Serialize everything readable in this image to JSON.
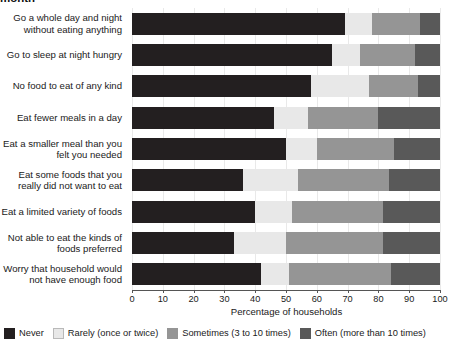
{
  "chart_data": {
    "type": "bar",
    "orientation": "horizontal",
    "stacked": true,
    "stacked_percent": true,
    "title": "month",
    "xlabel": "Percentage of households",
    "ylabel": "",
    "xlim": [
      0,
      100
    ],
    "xticks": [
      0,
      10,
      20,
      30,
      40,
      50,
      60,
      70,
      80,
      90,
      100
    ],
    "xtick_labels": [
      "0",
      "10",
      "20",
      "30",
      "40",
      "50",
      "60",
      "70",
      "80",
      "90",
      "100"
    ],
    "grid": true,
    "legend_position": "bottom",
    "categories": [
      "Go a whole day and night without eating anything",
      "Go to sleep at night hungry",
      "No food to eat of any kind",
      "Eat fewer meals in a day",
      "Eat a smaller meal than you felt you needed",
      "Eat some foods that you really did not want to eat",
      "Eat a limited variety of foods",
      "Not able to eat the kinds of foods preferred",
      "Worry that household would not have enough food"
    ],
    "series": [
      {
        "name": "Never",
        "color": "#231f20",
        "values": [
          69,
          65,
          58,
          46,
          50,
          36,
          40,
          33,
          42
        ]
      },
      {
        "name": "Rarely (once or twice)",
        "color": "#e8e8e8",
        "values": [
          9,
          9,
          19,
          11,
          10,
          18,
          12,
          17,
          9
        ]
      },
      {
        "name": "Sometimes (3 to 10 times)",
        "color": "#959595",
        "values": [
          15.5,
          18,
          16,
          23,
          25,
          29.5,
          29.5,
          31.5,
          33
        ]
      },
      {
        "name": "Often (more than 10 times)",
        "color": "#595959",
        "values": [
          6.5,
          8,
          7,
          20,
          15,
          16.5,
          18.5,
          18.5,
          16
        ]
      }
    ]
  },
  "legend": {
    "items": [
      {
        "label": "Never",
        "color": "#231f20",
        "outlined": false
      },
      {
        "label": "Rarely (once or twice)",
        "color": "#e8e8e8",
        "outlined": true
      },
      {
        "label": "Sometimes (3 to 10 times)",
        "color": "#959595",
        "outlined": false
      },
      {
        "label": "Often (more than 10 times)",
        "color": "#595959",
        "outlined": false
      }
    ]
  }
}
